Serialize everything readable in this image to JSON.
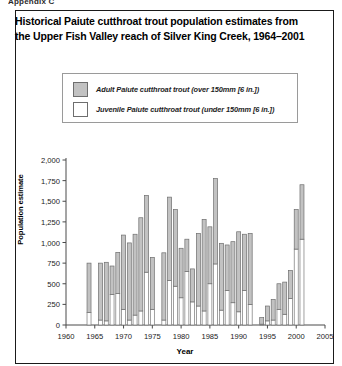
{
  "top_clip_text": "Appendix C",
  "figure": {
    "title": "Historical Paiute cutthroat trout population estimates from the Upper Fish Valley reach of Silver King Creek, 1964–2001",
    "legend": {
      "items": [
        {
          "label": "Adult Paiute cutthroat trout (over 150mm [6 in.])",
          "swatch": "adult",
          "color": "#c2c2c2"
        },
        {
          "label": "Juvenile Paiute cutthroat trout (under 150mm [6 in.])",
          "swatch": "juvenile",
          "color": "#ffffff"
        }
      ]
    }
  },
  "chart_data": {
    "type": "bar",
    "title": "Historical Paiute cutthroat trout population estimates from the Upper Fish Valley reach of Silver King Creek, 1964–2001",
    "xlabel": "Year",
    "ylabel": "Population estimate",
    "xlim": [
      1960,
      2005
    ],
    "ylim": [
      0,
      2000
    ],
    "ytick_values": [
      0,
      250,
      500,
      750,
      1000,
      1250,
      1500,
      1750,
      2000
    ],
    "ytick_labels": [
      "0",
      "250",
      "500",
      "750",
      "1,000",
      "1,250",
      "1,500",
      "1,750",
      "2,000"
    ],
    "xtick_values": [
      1960,
      1965,
      1970,
      1975,
      1980,
      1985,
      1990,
      1995,
      2000,
      2005
    ],
    "xtick_labels": [
      "1960",
      "1965",
      "1970",
      "1975",
      "1980",
      "1985",
      "1990",
      "1995",
      "2000",
      "2005"
    ],
    "grid": false,
    "legend_position": "above-plot",
    "stacked": true,
    "series": [
      {
        "name": "Juvenile Paiute cutthroat trout (under 150mm [6 in.])",
        "color": "#ffffff"
      },
      {
        "name": "Adult Paiute cutthroat trout (over 150mm [6 in.])",
        "color": "#c2c2c2"
      }
    ],
    "categories": [
      1964,
      1966,
      1967,
      1968,
      1969,
      1970,
      1971,
      1972,
      1973,
      1974,
      1975,
      1977,
      1978,
      1979,
      1980,
      1981,
      1982,
      1983,
      1984,
      1985,
      1986,
      1987,
      1988,
      1989,
      1990,
      1991,
      1992,
      1994,
      1995,
      1996,
      1997,
      1998,
      1999,
      2000,
      2001
    ],
    "values": {
      "juvenile": [
        150,
        60,
        50,
        370,
        380,
        190,
        60,
        120,
        170,
        640,
        190,
        60,
        540,
        470,
        330,
        650,
        280,
        230,
        170,
        500,
        740,
        180,
        420,
        270,
        160,
        420,
        250,
        10,
        50,
        60,
        190,
        130,
        320,
        920,
        1040
      ],
      "adult": [
        600,
        690,
        710,
        345,
        500,
        900,
        935,
        980,
        1130,
        930,
        630,
        815,
        1010,
        930,
        600,
        390,
        400,
        880,
        1110,
        690,
        1035,
        810,
        550,
        740,
        970,
        680,
        860,
        80,
        180,
        250,
        310,
        390,
        340,
        480,
        660
      ]
    },
    "totals": [
      750,
      750,
      760,
      715,
      880,
      1090,
      995,
      1100,
      1300,
      1570,
      820,
      875,
      1550,
      1400,
      930,
      1040,
      680,
      1110,
      1280,
      1190,
      1775,
      990,
      970,
      1010,
      1130,
      1100,
      1110,
      90,
      230,
      310,
      500,
      520,
      660,
      1400,
      1700
    ]
  }
}
